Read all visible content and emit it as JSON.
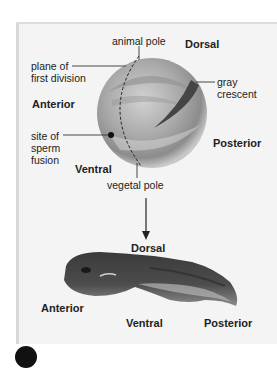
{
  "egg": {
    "labels": {
      "animal_pole": "animal pole",
      "dorsal": "Dorsal",
      "plane_line1": "plane of",
      "plane_line2": "first division",
      "gray_line1": "gray",
      "gray_line2": "crescent",
      "anterior": "Anterior",
      "sperm_line1": "site of",
      "sperm_line2": "sperm",
      "sperm_line3": "fusion",
      "posterior": "Posterior",
      "ventral": "Ventral",
      "vegetal_pole": "vegetal pole"
    }
  },
  "tadpole": {
    "labels": {
      "dorsal": "Dorsal",
      "anterior": "Anterior",
      "ventral": "Ventral",
      "posterior": "Posterior"
    }
  },
  "colors": {
    "panel_bg": "#f4f4f4",
    "egg_base": "#b5b5b5",
    "gray_crescent": "#4a4a4a",
    "line": "#333333"
  }
}
